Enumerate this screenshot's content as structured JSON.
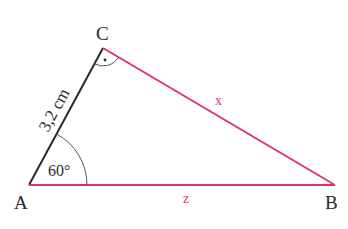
{
  "diagram": {
    "type": "right-triangle",
    "vertices": {
      "A": {
        "label": "A"
      },
      "B": {
        "label": "B"
      },
      "C": {
        "label": "C"
      }
    },
    "sides": {
      "AC": {
        "label": "3,2 cm",
        "color": "#2a2a2a"
      },
      "CB": {
        "label": "x",
        "color": "#e0305f"
      },
      "AB": {
        "label": "z",
        "color": "#e0305f"
      }
    },
    "angles": {
      "A": {
        "label": "60°"
      },
      "C": {
        "label": "right-angle-dot",
        "value": "90°"
      }
    }
  }
}
